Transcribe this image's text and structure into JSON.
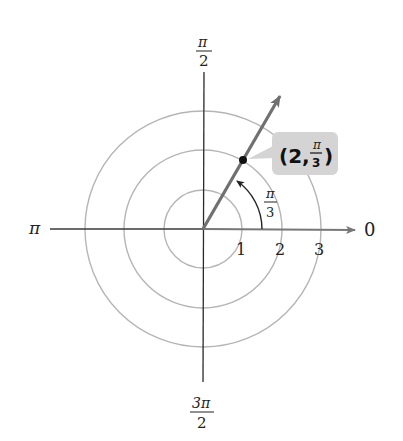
{
  "diagram": {
    "type": "polar-coordinate-plot",
    "center": {
      "x": 203,
      "y": 229
    },
    "unit_px": 39.5,
    "colors": {
      "axis": "#2a2a2a",
      "polar_axis": "#777777",
      "circles": "#b5b5b5",
      "ray": "#707070",
      "point": "#111111",
      "callout_bg": "#d4d4d4",
      "arc": "#222222"
    },
    "angle_labels": {
      "top": {
        "num": "π",
        "den": "2"
      },
      "left": "π",
      "right": "0",
      "bottom": {
        "num": "3π",
        "den": "2"
      }
    },
    "radius_labels": [
      "1",
      "2",
      "3"
    ],
    "angle_marker": {
      "num": "π",
      "den": "3"
    },
    "point": {
      "r": 2,
      "theta_deg": 60,
      "label_prefix": "(2, ",
      "label_num": "π",
      "label_den": "3",
      "label_suffix": ")"
    }
  }
}
